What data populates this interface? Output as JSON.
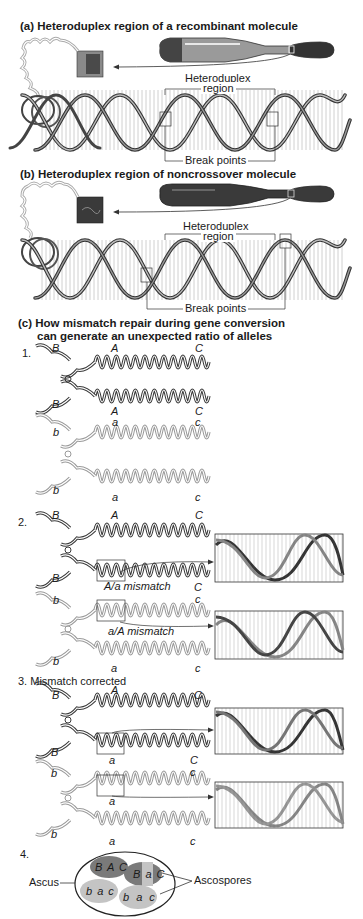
{
  "panel_a": {
    "title": "(a)  Heteroduplex region of a recombinant molecule",
    "heteroduplex_label_1": "Heteroduplex",
    "heteroduplex_label_2": "region",
    "break_points_label": "Break points"
  },
  "panel_b": {
    "title": "(b)  Heteroduplex region of noncrossover molecule",
    "heteroduplex_label_1": "Heteroduplex",
    "heteroduplex_label_2": "region",
    "break_points_label": "Break points"
  },
  "panel_c": {
    "title_line1": "(c)  How mismatch repair during gene conversion",
    "title_line2": "can generate an unexpected ratio of alleles",
    "step1": {
      "number": "1.",
      "dark_top": {
        "left": "B",
        "mid": "A",
        "right": "C"
      },
      "dark_bottom": {
        "left": "B",
        "mid": "A",
        "right": "C"
      },
      "light_top": {
        "left": "b",
        "mid": "a",
        "right": "c"
      },
      "light_bottom": {
        "left": "b",
        "mid": "a",
        "right": "c"
      }
    },
    "step2": {
      "number": "2.",
      "dark_top": {
        "left": "B",
        "mid": "A",
        "right": "C"
      },
      "dark_bottom": {
        "left": "B",
        "right": "C"
      },
      "mismatch_1": "A/a mismatch",
      "light_top": {
        "left": "b",
        "right": "c"
      },
      "mismatch_2": "a/A mismatch",
      "light_bottom": {
        "left": "b",
        "mid": "a",
        "right": "c"
      }
    },
    "step3": {
      "title": "3. Mismatch corrected",
      "dark_top": {
        "left": "B",
        "mid": "A",
        "right": "C"
      },
      "dark_bottom": {
        "left": "B",
        "mid": "a",
        "right": "C"
      },
      "light_top": {
        "left": "b",
        "mid": "a",
        "right": "c"
      },
      "light_bottom": {
        "left": "b",
        "mid": "a",
        "right": "c"
      }
    },
    "step4": {
      "number": "4.",
      "ascus_label": "Ascus",
      "ascospores_label": "Ascospores",
      "spores": [
        "B A C",
        "B a C",
        "b a c",
        "b a c"
      ]
    }
  },
  "colors": {
    "dark_strand": "#3a3a3a",
    "light_strand": "#9a9a9a",
    "dark_spore": "#7a7a7a",
    "light_spore": "#c4c4c4"
  }
}
